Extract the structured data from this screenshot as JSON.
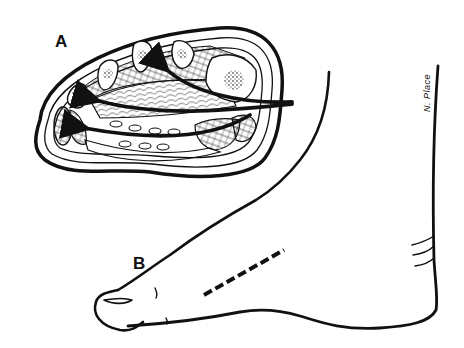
{
  "figure": {
    "panels": [
      {
        "id": "A",
        "label": "A",
        "description": "Cross-section of the foot with arrows indicating approach"
      },
      {
        "id": "B",
        "label": "B",
        "description": "Dorsal-lateral view of foot with dashed incision line"
      }
    ],
    "signature": "N. Place",
    "colors": {
      "ink": "#111111",
      "background": "#ffffff"
    }
  }
}
